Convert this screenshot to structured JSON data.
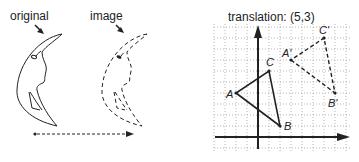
{
  "left_diagram": {
    "labels": {
      "original": "original",
      "image": "image"
    },
    "description": "crescent moon face translated horizontally; original solid, image dashed, dotted arrow showing translation"
  },
  "right_diagram": {
    "title": "translation: (5,3)",
    "grid": {
      "x_range": [
        -4,
        8
      ],
      "y_range": [
        -1,
        10
      ],
      "style": "dotted"
    },
    "original_triangle": {
      "style": "solid",
      "points": [
        {
          "label": "A",
          "x": -2,
          "y": 4
        },
        {
          "label": "B",
          "x": 2,
          "y": 1
        },
        {
          "label": "C",
          "x": 1,
          "y": 6
        }
      ]
    },
    "image_triangle": {
      "style": "dashed",
      "points": [
        {
          "label": "A'",
          "x": 3,
          "y": 7
        },
        {
          "label": "B'",
          "x": 7,
          "y": 4
        },
        {
          "label": "C'",
          "x": 6,
          "y": 9
        }
      ]
    }
  }
}
